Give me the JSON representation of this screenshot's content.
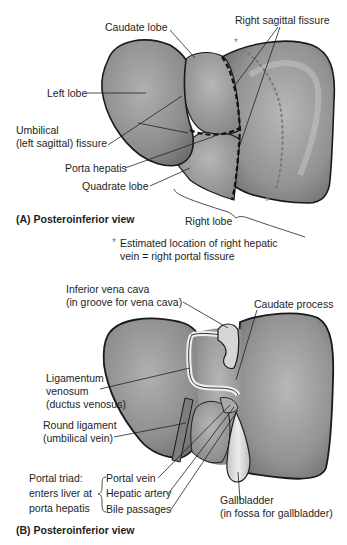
{
  "figure": {
    "panel_a": {
      "caption": "(A) Posteroinferior view",
      "labels": {
        "caudate_lobe": "Caudate lobe",
        "right_sagittal_fissure": "Right sagittal fissure",
        "left_lobe": "Left lobe",
        "umbilical_line1": "Umbilical",
        "umbilical_line2": "(left sagittal) fissure",
        "porta_hepatis": "Porta hepatis",
        "quadrate_lobe": "Quadrate lobe",
        "right_lobe": "Right lobe"
      },
      "footnote": {
        "marker": "*",
        "line1": "Estimated location of right hepatic",
        "line2": "vein = right portal fissure"
      }
    },
    "panel_b": {
      "caption": "(B) Posteroinferior view",
      "labels": {
        "ivc_line1": "Inferior vena cava",
        "ivc_line2": "(in groove for vena cava)",
        "caudate_process": "Caudate process",
        "lig_venosum_line1": "Ligamentum",
        "lig_venosum_line2": "venosum",
        "lig_venosum_line3": "(ductus venosus)",
        "round_lig_line1": "Round ligament",
        "round_lig_line2": "(umbilical vein)",
        "portal_triad_line1": "Portal triad:",
        "portal_triad_line2": "enters liver at",
        "portal_triad_line3": "porta hepatis",
        "portal_vein": "Portal vein",
        "hepatic_artery": "Hepatic artery",
        "bile_passages": "Bile passages",
        "gallbladder_line1": "Gallbladder",
        "gallbladder_line2": "(in fossa for gallbladder)"
      }
    },
    "colors": {
      "liver_fill": "#8f8f8f",
      "liver_light": "#b4b4b4",
      "outline": "#1a1a1a",
      "gallbladder": "#dcdcdc",
      "dotted_line": "#7a7a7a"
    }
  }
}
